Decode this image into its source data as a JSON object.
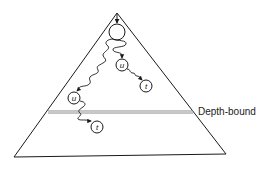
{
  "diagram": {
    "type": "search-tree-depth-bound",
    "colors": {
      "stroke": "#1a1a1a",
      "bound_line": "#888888",
      "background": "#ffffff"
    },
    "tree": {
      "apex": [
        117,
        13
      ],
      "bottom_left": [
        14,
        157
      ],
      "bottom_right": [
        226,
        154
      ]
    },
    "depth_bound": {
      "label": "Depth-bound",
      "y": 112,
      "x_start": 48,
      "x_end": 193
    },
    "nodes": [
      {
        "id": "root",
        "label": "",
        "cx": 117,
        "cy": 32,
        "r": 8
      },
      {
        "id": "u1",
        "label": "u",
        "cx": 122,
        "cy": 65,
        "r": 6
      },
      {
        "id": "t1",
        "label": "t",
        "cx": 146,
        "cy": 86,
        "r": 6
      },
      {
        "id": "u2",
        "label": "u",
        "cx": 74,
        "cy": 98,
        "r": 6
      },
      {
        "id": "t2",
        "label": "t",
        "cx": 97,
        "cy": 127,
        "r": 6
      }
    ],
    "paths": [
      {
        "from": "entry",
        "to": "root",
        "style": "straight-arrow"
      },
      {
        "from": "root",
        "to": "u1",
        "style": "wavy-arrow"
      },
      {
        "from": "u1",
        "to": "t1",
        "style": "wavy-arrow"
      },
      {
        "from": "root",
        "to": "u2",
        "style": "wavy-arrow"
      },
      {
        "from": "u2",
        "to": "t2",
        "style": "wavy-arrow",
        "crosses_depth_bound": true
      }
    ]
  }
}
